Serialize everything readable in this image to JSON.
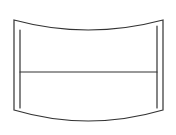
{
  "figure": {
    "stroke_color": "#333333",
    "background": "#ffffff"
  }
}
